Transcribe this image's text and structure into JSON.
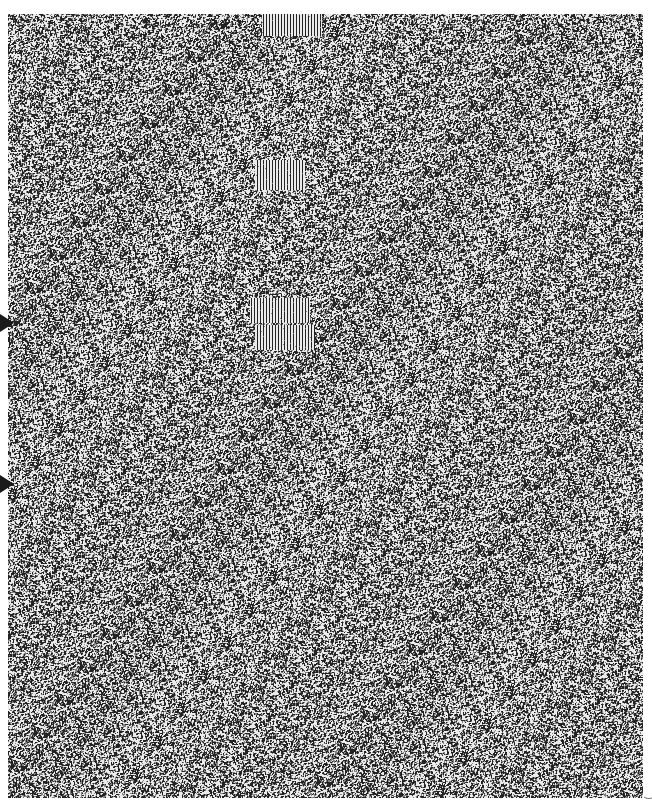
{
  "figure": {
    "panel": {
      "x": 8,
      "y": 14,
      "width": 635,
      "height": 784
    },
    "background_color": "#ffffff",
    "noise": {
      "dark": "#1e1e1e",
      "light": "#f2f2f2",
      "mean_gray": "#8a8a8a"
    },
    "streak_patches": [
      {
        "x": 262,
        "y": 14,
        "width": 60,
        "height": 22
      },
      {
        "x": 255,
        "y": 160,
        "width": 50,
        "height": 30
      },
      {
        "x": 250,
        "y": 298,
        "width": 60,
        "height": 25
      },
      {
        "x": 255,
        "y": 325,
        "width": 60,
        "height": 25
      }
    ],
    "markers": [
      {
        "name": "arrow-marker-upper",
        "x": 0,
        "y": 314
      },
      {
        "name": "arrow-marker-lower",
        "x": 0,
        "y": 475
      }
    ],
    "side_label": "("
  }
}
